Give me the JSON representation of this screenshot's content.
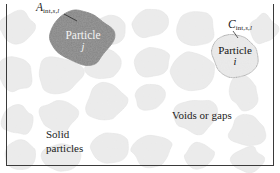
{
  "figure": {
    "width": 280,
    "height": 173,
    "background": "#ffffff"
  },
  "colors": {
    "background": "#ffffff",
    "particle_light_fill": "#e9e9e9",
    "particle_light_stroke": "#d8d8d8",
    "particle_highlight_fill": "#e4e4e4",
    "particle_highlight_stroke": "#4a4a4a",
    "particle_dark_fill": "#6d6d6d",
    "particle_dark_stroke": "#5a5a5a",
    "frame_line": "#3a3a3a",
    "text_dark": "#1b1b1b",
    "text_light": "#f4f4f4"
  },
  "labels": {
    "area_symbol": "A",
    "area_subscript_parts": [
      "int,",
      "s",
      ",",
      "l"
    ],
    "area_subscript": "int,s,l",
    "conc_symbol": "C",
    "conc_subscript_parts": [
      "int,",
      "s",
      ",",
      "l"
    ],
    "conc_subscript": "int,s,l",
    "particle_j_name": "Particle",
    "particle_j_index": "j",
    "particle_i_name": "Particle",
    "particle_i_index": "i",
    "voids": "Voids or gaps",
    "solid_line1": "Solid",
    "solid_line2": "particles"
  },
  "leader_lines": [
    {
      "name": "leader-a-int",
      "x1": 64,
      "y1": 14,
      "x2": 77,
      "y2": 21
    },
    {
      "name": "leader-c-int",
      "x1": 233,
      "y1": 31,
      "x2": 238,
      "y2": 38
    }
  ],
  "particles": [
    {
      "name": "particle-bg-1",
      "cx": 18,
      "cy": 28,
      "rx": 19,
      "ry": 17,
      "seed": 11,
      "style": "light"
    },
    {
      "name": "particle-bg-2",
      "cx": 17,
      "cy": 74,
      "rx": 18,
      "ry": 19,
      "seed": 23,
      "style": "light"
    },
    {
      "name": "particle-bg-3",
      "cx": 16,
      "cy": 120,
      "rx": 16,
      "ry": 16,
      "seed": 37,
      "style": "light"
    },
    {
      "name": "particle-bg-4",
      "cx": 20,
      "cy": 154,
      "rx": 17,
      "ry": 14,
      "seed": 41,
      "style": "light"
    },
    {
      "name": "particle-bg-5",
      "cx": 60,
      "cy": 74,
      "rx": 22,
      "ry": 19,
      "seed": 53,
      "style": "light"
    },
    {
      "name": "particle-bg-6",
      "cx": 58,
      "cy": 116,
      "rx": 20,
      "ry": 18,
      "seed": 59,
      "style": "light"
    },
    {
      "name": "particle-bg-7",
      "cx": 61,
      "cy": 157,
      "rx": 19,
      "ry": 14,
      "seed": 67,
      "style": "light"
    },
    {
      "name": "particle-bg-8",
      "cx": 110,
      "cy": 30,
      "rx": 17,
      "ry": 15,
      "seed": 71,
      "style": "light"
    },
    {
      "name": "particle-bg-9",
      "cx": 104,
      "cy": 65,
      "rx": 19,
      "ry": 15,
      "seed": 79,
      "style": "light"
    },
    {
      "name": "particle-bg-10",
      "cx": 105,
      "cy": 104,
      "rx": 21,
      "ry": 19,
      "seed": 83,
      "style": "light"
    },
    {
      "name": "particle-bg-11",
      "cx": 108,
      "cy": 147,
      "rx": 20,
      "ry": 17,
      "seed": 89,
      "style": "light"
    },
    {
      "name": "particle-bg-12",
      "cx": 150,
      "cy": 23,
      "rx": 18,
      "ry": 15,
      "seed": 97,
      "style": "light"
    },
    {
      "name": "particle-bg-13",
      "cx": 152,
      "cy": 63,
      "rx": 19,
      "ry": 16,
      "seed": 101,
      "style": "light"
    },
    {
      "name": "particle-bg-14",
      "cx": 150,
      "cy": 97,
      "rx": 16,
      "ry": 13,
      "seed": 103,
      "style": "light"
    },
    {
      "name": "particle-bg-15",
      "cx": 152,
      "cy": 152,
      "rx": 22,
      "ry": 16,
      "seed": 107,
      "style": "light"
    },
    {
      "name": "particle-bg-16",
      "cx": 196,
      "cy": 28,
      "rx": 19,
      "ry": 16,
      "seed": 109,
      "style": "light"
    },
    {
      "name": "particle-bg-17",
      "cx": 192,
      "cy": 72,
      "rx": 21,
      "ry": 18,
      "seed": 113,
      "style": "light"
    },
    {
      "name": "particle-bg-18",
      "cx": 196,
      "cy": 116,
      "rx": 21,
      "ry": 18,
      "seed": 127,
      "style": "light"
    },
    {
      "name": "particle-bg-19",
      "cx": 200,
      "cy": 155,
      "rx": 17,
      "ry": 13,
      "seed": 131,
      "style": "light"
    },
    {
      "name": "particle-bg-20",
      "cx": 243,
      "cy": 92,
      "rx": 17,
      "ry": 17,
      "seed": 137,
      "style": "light"
    },
    {
      "name": "particle-bg-21",
      "cx": 248,
      "cy": 131,
      "rx": 19,
      "ry": 16,
      "seed": 139,
      "style": "light"
    },
    {
      "name": "particle-bg-22",
      "cx": 247,
      "cy": 160,
      "rx": 18,
      "ry": 13,
      "seed": 149,
      "style": "light"
    },
    {
      "name": "particle-bg-23",
      "cx": 263,
      "cy": 30,
      "rx": 15,
      "ry": 15,
      "seed": 151,
      "style": "light"
    },
    {
      "name": "particle-i",
      "cx": 235,
      "cy": 55,
      "rx": 24,
      "ry": 22,
      "seed": 163,
      "style": "highlight"
    },
    {
      "name": "particle-j",
      "cx": 83,
      "cy": 38,
      "rx": 31,
      "ry": 26,
      "seed": 173,
      "style": "dark"
    }
  ]
}
